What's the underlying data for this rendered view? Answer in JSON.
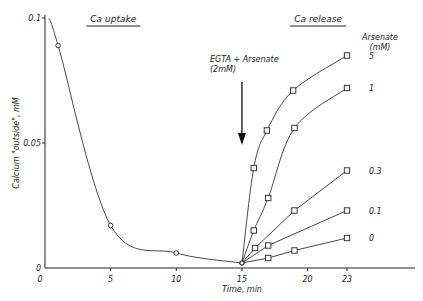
{
  "chart_data": {
    "type": "line",
    "title": "",
    "xlabel": "Time, min",
    "ylabel": "Calcium \"outside\", mM",
    "xlim": [
      0,
      27
    ],
    "ylim": [
      0,
      0.1
    ],
    "x_ticks": [
      "0",
      "5",
      "10",
      "15",
      "20",
      "23"
    ],
    "y_ticks": [
      "0",
      "0.05",
      "0.1"
    ],
    "grid": false,
    "section_labels": [
      "Ca uptake",
      "Ca release"
    ],
    "annotation": {
      "text_line1": "EGTA + Arsenate",
      "text_line2": "(2mM)",
      "x": 15
    },
    "legend_title_line1": "Arsenate",
    "legend_title_line2": "(mM)",
    "series": [
      {
        "name": "uptake",
        "marker": "circle",
        "points": [
          [
            1,
            0.089
          ],
          [
            5,
            0.017
          ],
          [
            10,
            0.006
          ],
          [
            15,
            0.002
          ]
        ]
      },
      {
        "name": "5",
        "marker": "square",
        "points": [
          [
            15,
            0.002
          ],
          [
            15.9,
            0.04
          ],
          [
            16.9,
            0.055
          ],
          [
            18.9,
            0.071
          ],
          [
            23,
            0.085
          ]
        ]
      },
      {
        "name": "1",
        "marker": "square",
        "points": [
          [
            15,
            0.002
          ],
          [
            15.9,
            0.015
          ],
          [
            17,
            0.028
          ],
          [
            19,
            0.056
          ],
          [
            23,
            0.072
          ]
        ]
      },
      {
        "name": "0.3",
        "marker": "square",
        "points": [
          [
            15,
            0.002
          ],
          [
            16,
            0.008
          ],
          [
            19,
            0.023
          ],
          [
            23,
            0.039
          ]
        ]
      },
      {
        "name": "0.1",
        "marker": "square",
        "points": [
          [
            15,
            0.002
          ],
          [
            17,
            0.009
          ],
          [
            23,
            0.023
          ]
        ]
      },
      {
        "name": "0",
        "marker": "square",
        "points": [
          [
            15,
            0.002
          ],
          [
            17,
            0.004
          ],
          [
            19,
            0.007
          ],
          [
            23,
            0.012
          ]
        ]
      }
    ]
  }
}
